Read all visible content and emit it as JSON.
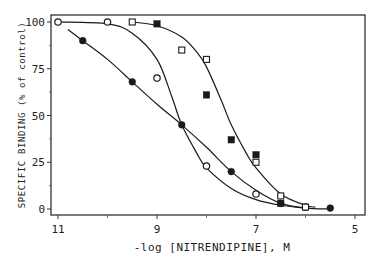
{
  "chart_data": {
    "type": "scatter",
    "title": "",
    "xlabel": "-log [NITRENDIPINE], M",
    "ylabel": "SPECIFIC BINDING (% of control)",
    "xlim": [
      11,
      5
    ],
    "ylim": [
      0,
      100
    ],
    "x_inverted": true,
    "x_ticks": [
      11,
      9,
      7,
      5
    ],
    "x_minor_ticks": [
      10,
      8,
      6
    ],
    "y_ticks": [
      0,
      25,
      50,
      75,
      100
    ],
    "grid": false,
    "legend": null,
    "series": [
      {
        "name": "open circles",
        "marker": "open-circle",
        "points": [
          [
            11.0,
            100
          ],
          [
            10.0,
            100
          ],
          [
            9.0,
            70
          ],
          [
            8.0,
            23
          ],
          [
            7.0,
            8
          ],
          [
            6.0,
            1
          ]
        ]
      },
      {
        "name": "filled circles",
        "marker": "filled-circle",
        "points": [
          [
            10.5,
            90
          ],
          [
            9.5,
            68
          ],
          [
            8.5,
            45
          ],
          [
            7.5,
            20
          ],
          [
            6.5,
            3
          ],
          [
            5.5,
            0.5
          ]
        ]
      },
      {
        "name": "open squares",
        "marker": "open-square",
        "points": [
          [
            9.5,
            100
          ],
          [
            8.5,
            85
          ],
          [
            8.0,
            80
          ],
          [
            7.0,
            25
          ],
          [
            6.5,
            7
          ],
          [
            6.0,
            1
          ]
        ]
      },
      {
        "name": "filled squares",
        "marker": "filled-square",
        "points": [
          [
            9.0,
            99
          ],
          [
            8.0,
            61
          ],
          [
            7.5,
            37
          ],
          [
            7.0,
            29
          ],
          [
            6.5,
            3
          ]
        ]
      }
    ],
    "fitted_curves": [
      {
        "name": "open-circle fit",
        "points": [
          [
            11.0,
            100
          ],
          [
            10.0,
            99
          ],
          [
            9.5,
            94
          ],
          [
            9.0,
            80
          ],
          [
            8.7,
            60
          ],
          [
            8.5,
            45
          ],
          [
            8.2,
            30
          ],
          [
            8.0,
            22
          ],
          [
            7.5,
            11
          ],
          [
            7.0,
            5
          ],
          [
            6.5,
            2
          ],
          [
            6.0,
            0.5
          ]
        ]
      },
      {
        "name": "filled-circle fit",
        "points": [
          [
            10.8,
            96
          ],
          [
            10.5,
            90
          ],
          [
            10.0,
            80
          ],
          [
            9.5,
            68
          ],
          [
            9.0,
            56
          ],
          [
            8.5,
            45
          ],
          [
            8.0,
            33
          ],
          [
            7.5,
            20
          ],
          [
            7.0,
            10
          ],
          [
            6.5,
            3
          ],
          [
            6.0,
            0.5
          ],
          [
            5.5,
            0
          ]
        ]
      },
      {
        "name": "square fit",
        "points": [
          [
            9.5,
            100
          ],
          [
            9.0,
            98
          ],
          [
            8.5,
            92
          ],
          [
            8.2,
            84
          ],
          [
            8.0,
            76
          ],
          [
            7.7,
            58
          ],
          [
            7.5,
            45
          ],
          [
            7.2,
            30
          ],
          [
            7.0,
            22
          ],
          [
            6.5,
            8
          ],
          [
            6.0,
            2
          ],
          [
            5.8,
            1
          ]
        ]
      }
    ]
  }
}
